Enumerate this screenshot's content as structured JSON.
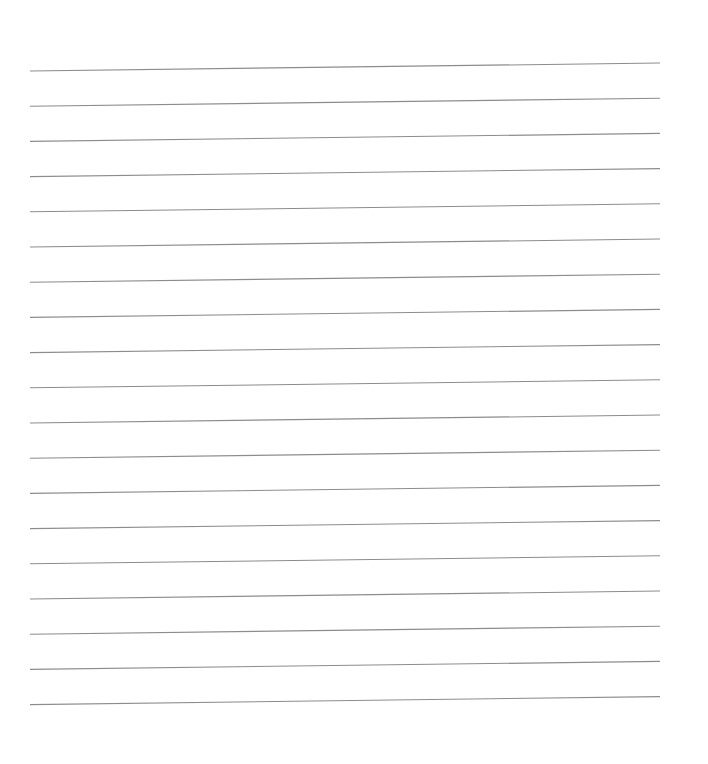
{
  "page": {
    "type": "lined-paper",
    "background_color": "#ffffff",
    "line_color": "#8c8c8c",
    "line_count": 19,
    "line_left_x": 30,
    "line_right_x": 660,
    "first_line_y_left": 71,
    "line_spacing": 35.2,
    "slope_rise_px": 8,
    "text_content": []
  }
}
